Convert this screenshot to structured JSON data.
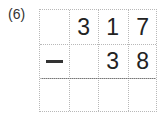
{
  "problem": {
    "label": "(6)",
    "operator": "minus",
    "rows": [
      [
        "",
        "3",
        "1",
        "7"
      ],
      [
        "-",
        "",
        "3",
        "8"
      ],
      [
        "",
        "",
        "",
        ""
      ]
    ]
  }
}
